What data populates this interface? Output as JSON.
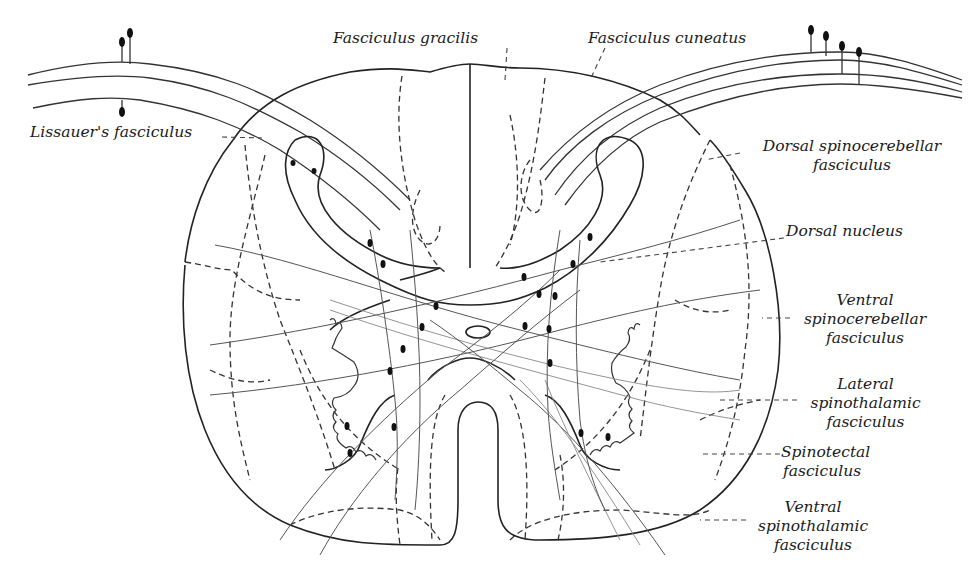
{
  "figure": {
    "labels": [
      {
        "id": "fasciculus-gracilis",
        "lines": [
          "Fasciculus gracilis"
        ]
      },
      {
        "id": "fasciculus-cuneatus",
        "lines": [
          "Fasciculus cuneatus"
        ]
      },
      {
        "id": "lissauers-fasciculus",
        "lines": [
          "Lissauer's fasciculus"
        ]
      },
      {
        "id": "dorsal-spinocerebellar-fasciculus",
        "lines": [
          "Dorsal spinocerebellar",
          "fasciculus"
        ]
      },
      {
        "id": "dorsal-nucleus",
        "lines": [
          "Dorsal nucleus"
        ]
      },
      {
        "id": "ventral-spinocerebellar-fasciculus",
        "lines": [
          "Ventral",
          "spinocerebellar",
          "fasciculus"
        ]
      },
      {
        "id": "lateral-spinothalamic-fasciculus",
        "lines": [
          "Lateral",
          "spinothalamic",
          "fasciculus"
        ]
      },
      {
        "id": "spinotectal-fasciculus",
        "lines": [
          "Spinotectal",
          "fasciculus"
        ]
      },
      {
        "id": "ventral-spinothalamic-fasciculus",
        "lines": [
          "Ventral",
          "spinothalamic",
          "fasciculus"
        ]
      }
    ],
    "structures": [
      "spinal-cord-outline",
      "gray-matter",
      "central-canal",
      "ventral-median-fissure",
      "dorsal-median-septum",
      "dorsal-root-left",
      "dorsal-root-right",
      "ganglion-cells"
    ]
  }
}
